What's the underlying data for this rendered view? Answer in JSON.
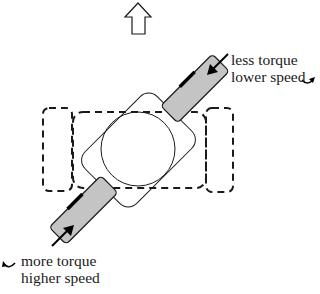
{
  "diagram": {
    "direction_arrow": {
      "icon": "up-arrow-outline-icon",
      "meaning": "forward direction"
    },
    "wheels": [
      {
        "id": "top-right",
        "label_line1": "less torque",
        "label_line2": "lower speed",
        "push_arrow_icon": "arrow-down-left-icon",
        "rotation_icon": "curved-rotation-arrow-icon"
      },
      {
        "id": "bottom-left",
        "label_line1": "more torque",
        "label_line2": "higher speed",
        "push_arrow_icon": "arrow-up-right-icon",
        "rotation_icon": "curved-rotation-arrow-icon"
      }
    ],
    "colors": {
      "wheel_fill": "#c4c4c4",
      "stroke": "#1a1a1a",
      "background": "#ffffff"
    }
  }
}
